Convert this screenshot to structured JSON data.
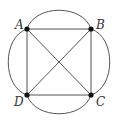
{
  "diagram": {
    "type": "multigraph",
    "vertices": [
      {
        "id": "A",
        "label": "A",
        "x": 27,
        "y": 29,
        "lx": 15,
        "ly": 29
      },
      {
        "id": "B",
        "label": "B",
        "x": 91,
        "y": 29,
        "lx": 96,
        "ly": 29
      },
      {
        "id": "C",
        "label": "C",
        "x": 91,
        "y": 95,
        "lx": 96,
        "ly": 106
      },
      {
        "id": "D",
        "label": "D",
        "x": 27,
        "y": 95,
        "lx": 14,
        "ly": 106
      }
    ],
    "straight_edges": [
      [
        "A",
        "B"
      ],
      [
        "B",
        "C"
      ],
      [
        "C",
        "D"
      ],
      [
        "D",
        "A"
      ],
      [
        "A",
        "C"
      ],
      [
        "B",
        "D"
      ]
    ],
    "curved_edges": [
      [
        "A",
        "B"
      ],
      [
        "B",
        "C"
      ],
      [
        "C",
        "D"
      ],
      [
        "D",
        "A"
      ]
    ],
    "colors": {
      "edge": "#555555",
      "vertex": "#111111",
      "label": "#333333"
    }
  }
}
